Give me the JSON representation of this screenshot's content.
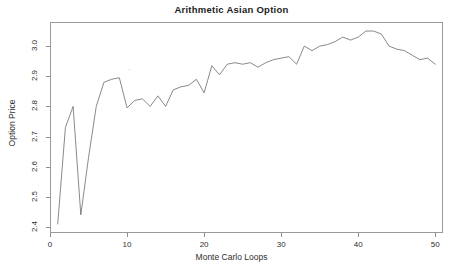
{
  "chart_data": {
    "type": "line",
    "title": "Arithmetic Asian Option",
    "xlabel": "Monte Carlo Loops",
    "ylabel": "Option Price",
    "xlim": [
      0,
      51
    ],
    "ylim": [
      2.38,
      3.08
    ],
    "xticks": [
      0,
      10,
      20,
      30,
      40,
      50
    ],
    "xtick_labels": [
      "0",
      "10",
      "20",
      "30",
      "40",
      "50"
    ],
    "yticks": [
      2.4,
      2.5,
      2.6,
      2.7,
      2.8,
      2.9,
      3.0
    ],
    "ytick_labels": [
      "2.4",
      "2.5",
      "2.6",
      "2.7",
      "2.8",
      "2.9",
      "3.0"
    ],
    "grid": false,
    "legend": null,
    "line_color": "#6b6b6b",
    "line_width": 0.8,
    "series": [
      {
        "name": "Option Price",
        "x": [
          1,
          2,
          3,
          4,
          5,
          6,
          7,
          8,
          9,
          10,
          11,
          12,
          13,
          14,
          15,
          16,
          17,
          18,
          19,
          20,
          21,
          22,
          23,
          24,
          25,
          26,
          27,
          28,
          29,
          30,
          31,
          32,
          33,
          34,
          35,
          36,
          37,
          38,
          39,
          40,
          41,
          42,
          43,
          44,
          45,
          46,
          47,
          48,
          49,
          50
        ],
        "values": [
          2.41,
          2.73,
          2.8,
          2.44,
          2.63,
          2.8,
          2.88,
          2.89,
          2.895,
          2.795,
          2.82,
          2.825,
          2.8,
          2.835,
          2.8,
          2.855,
          2.865,
          2.87,
          2.89,
          2.845,
          2.935,
          2.905,
          2.94,
          2.945,
          2.94,
          2.945,
          2.93,
          2.945,
          2.955,
          2.96,
          2.965,
          2.94,
          3.0,
          2.985,
          3.0,
          3.005,
          3.015,
          3.03,
          3.02,
          3.03,
          3.05,
          3.05,
          3.04,
          3.0,
          2.99,
          2.985,
          2.97,
          2.955,
          2.96,
          2.94
        ]
      }
    ]
  },
  "axes": {
    "title": "Arithmetic Asian Option",
    "x_label": "Monte Carlo Loops",
    "y_label": "Option Price"
  }
}
